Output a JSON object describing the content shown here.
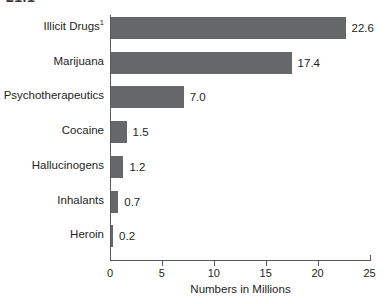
{
  "crop_fragment": "21.1",
  "chart_data": {
    "type": "bar",
    "orientation": "horizontal",
    "title": "",
    "subtitle": "",
    "xlabel": "Numbers in Millions",
    "ylabel": "",
    "xlim": [
      0,
      25
    ],
    "xticks": [
      0,
      5,
      10,
      15,
      20,
      25
    ],
    "xtick_labels": [
      "0",
      "5",
      "10",
      "15",
      "20",
      "25"
    ],
    "grid": false,
    "legend": false,
    "bar_color": "#666769",
    "axis_color": "#58595b",
    "text_color": "#231f20",
    "background": "#ffffff",
    "categories": [
      "Illicit Drugs",
      "Marijuana",
      "Psychotherapeutics",
      "Cocaine",
      "Hallucinogens",
      "Inhalants",
      "Heroin"
    ],
    "category_footnotes": [
      "1",
      "",
      "",
      "",
      "",
      "",
      ""
    ],
    "values": [
      22.6,
      17.4,
      7.0,
      1.5,
      1.2,
      0.7,
      0.2
    ],
    "value_labels": [
      "22.6",
      "17.4",
      "7.0",
      "1.5",
      "1.2",
      "0.7",
      "0.2"
    ]
  }
}
